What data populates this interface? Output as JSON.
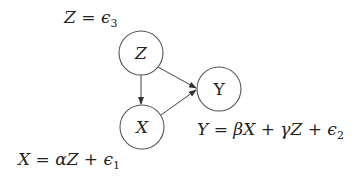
{
  "diagram": {
    "type": "causal-dag",
    "nodes": [
      {
        "id": "Z",
        "label": "Z",
        "italic": true,
        "cx": 141,
        "cy": 53,
        "r": 22
      },
      {
        "id": "X",
        "label": "X",
        "italic": true,
        "cx": 142,
        "cy": 127,
        "r": 22
      },
      {
        "id": "Y",
        "label": "Y",
        "italic": false,
        "cx": 219,
        "cy": 89,
        "r": 22
      }
    ],
    "edges": [
      {
        "from": "Z",
        "to": "X"
      },
      {
        "from": "Z",
        "to": "Y"
      },
      {
        "from": "X",
        "to": "Y"
      }
    ],
    "equations": {
      "z": {
        "lhs": "Z",
        "eq": " = ",
        "term": "ϵ",
        "sub": "3"
      },
      "x": {
        "lhs": "X",
        "eq": " = ",
        "a": "αZ",
        "plus": " + ",
        "term": "ϵ",
        "sub": "1"
      },
      "y": {
        "lhs": "Y",
        "eq": " = ",
        "b": "βX",
        "plus1": " + ",
        "c": "γZ",
        "plus2": " + ",
        "term": "ϵ",
        "sub": "2"
      }
    },
    "colors": {
      "stroke": "#555555",
      "text": "#222222",
      "background": "#ffffff"
    }
  }
}
